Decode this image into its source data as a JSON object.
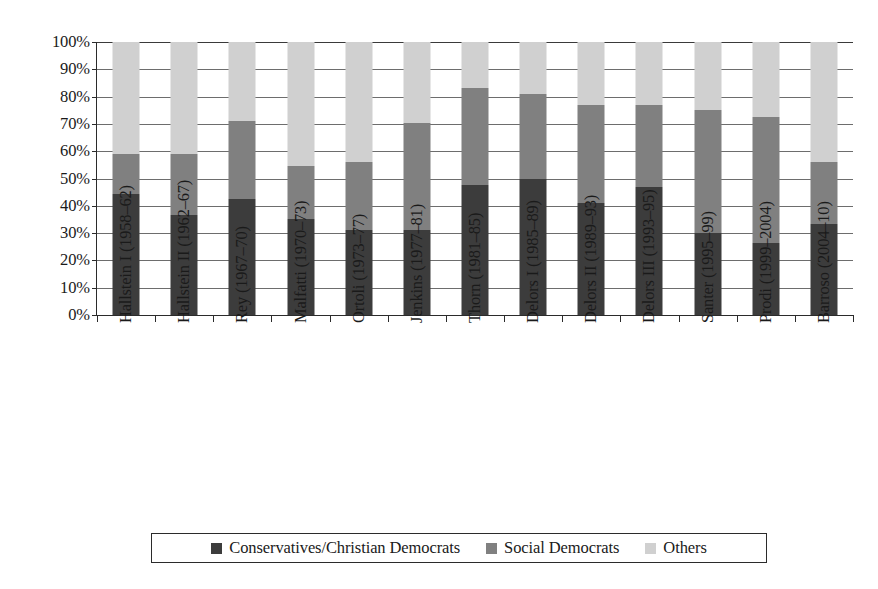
{
  "chart_data": {
    "type": "bar",
    "subtype": "stacked-percentage",
    "title": "",
    "xlabel": "",
    "ylabel": "",
    "ylim": [
      0,
      100
    ],
    "yunit": "%",
    "grid": true,
    "legend_position": "bottom",
    "categories": [
      "Hallstein I (1958–62)",
      "Hallstein II (1962–67)",
      "Rey (1967–70)",
      "Malfatti (1970–73)",
      "Ortoli (1973–77)",
      "Jenkins (1977–81)",
      "Thorn (1981–85)",
      "Delors I (1985–89)",
      "Delors II (1989–93)",
      "Delors III (1993–95)",
      "Santer (1995–99)",
      "Prodi (1999–2004)",
      "Barroso (2004–10)"
    ],
    "ytick_labels": [
      "0%",
      "10%",
      "20%",
      "30%",
      "40%",
      "50%",
      "60%",
      "70%",
      "80%",
      "90%",
      "100%"
    ],
    "ytick_values": [
      0,
      10,
      20,
      30,
      40,
      50,
      60,
      70,
      80,
      90,
      100
    ],
    "series": [
      {
        "name": "Conservatives/Christian Democrats",
        "color": "#3c3c3c",
        "values": [
          44.5,
          36.5,
          42.5,
          35.0,
          31.0,
          31.0,
          47.5,
          50.0,
          41.0,
          47.0,
          30.0,
          26.5,
          33.5
        ]
      },
      {
        "name": "Social Democrats",
        "color": "#808080",
        "values": [
          14.5,
          22.5,
          28.5,
          19.5,
          25.0,
          39.5,
          35.5,
          31.0,
          36.0,
          30.0,
          45.0,
          46.0,
          22.5
        ]
      },
      {
        "name": "Others",
        "color": "#d0d0d0",
        "values": [
          41.0,
          41.0,
          29.0,
          45.5,
          44.0,
          29.5,
          17.0,
          19.0,
          23.0,
          23.0,
          25.0,
          27.5,
          44.0
        ]
      }
    ],
    "stack_tops": {
      "conservatives": [
        44.5,
        36.5,
        42.5,
        35.0,
        31.0,
        31.0,
        47.5,
        50.0,
        41.0,
        47.0,
        30.0,
        26.5,
        33.5
      ],
      "plus_social_democrats": [
        59.0,
        59.0,
        71.0,
        54.5,
        56.0,
        70.5,
        83.0,
        81.0,
        77.0,
        77.0,
        75.0,
        72.5,
        56.0
      ],
      "total": [
        100,
        100,
        100,
        100,
        100,
        100,
        100,
        100,
        100,
        100,
        100,
        100,
        100
      ]
    }
  },
  "legend": {
    "items": [
      {
        "label": "Conservatives/Christian Democrats",
        "color": "#3c3c3c"
      },
      {
        "label": "Social Democrats",
        "color": "#808080"
      },
      {
        "label": "Others",
        "color": "#d0d0d0"
      }
    ]
  },
  "axis": {
    "y_tick_labels": [
      "100%",
      "90%",
      "80%",
      "70%",
      "60%",
      "50%",
      "40%",
      "30%",
      "20%",
      "10%",
      "0%"
    ]
  }
}
